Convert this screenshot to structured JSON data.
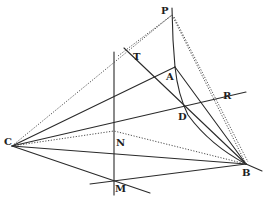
{
  "diagram": {
    "type": "geometric-construction",
    "colors": {
      "ink": "#2a2a2a",
      "background": "#ffffff"
    },
    "points": {
      "P": {
        "label": "P",
        "x": 172,
        "y": 15
      },
      "A": {
        "label": "A",
        "x": 175,
        "y": 67
      },
      "D": {
        "label": "D",
        "x": 184,
        "y": 107
      },
      "C": {
        "label": "C",
        "x": 12,
        "y": 146
      },
      "B": {
        "label": "B",
        "x": 246,
        "y": 164
      },
      "N": {
        "label": "N",
        "x": 114,
        "y": 131
      },
      "M": {
        "label": "M",
        "x": 114,
        "y": 180
      },
      "T": {
        "label": "T"
      },
      "R": {
        "label": "R"
      }
    },
    "labels": {
      "P": "P",
      "T": "T",
      "A": "A",
      "R": "R",
      "D": "D",
      "C": "C",
      "N": "N",
      "B": "B",
      "M": "M"
    }
  }
}
